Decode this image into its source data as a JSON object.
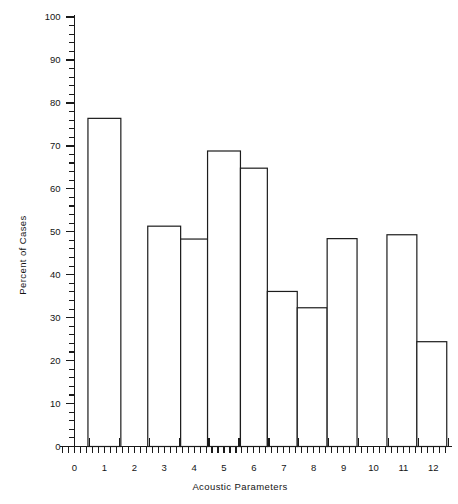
{
  "chart_data": {
    "type": "bar",
    "title": "",
    "subtitle": "",
    "xlabel": "Acoustic Parameters",
    "ylabel": "Percent of Cases",
    "xlim": [
      -0.4,
      12.4
    ],
    "ylim": [
      0,
      100
    ],
    "grid": false,
    "legend": null,
    "x_tick_labels": [
      "0",
      "1",
      "2",
      "3",
      "4",
      "5",
      "6",
      "7",
      "8",
      "9",
      "10",
      "11",
      "12"
    ],
    "x_tick_values": [
      0,
      1,
      2,
      3,
      4,
      5,
      6,
      7,
      8,
      9,
      10,
      11,
      12
    ],
    "x_minor_tick_step": 0.2,
    "y_tick_labels": [
      "0",
      "10",
      "20",
      "30",
      "40",
      "50",
      "60",
      "70",
      "80",
      "90",
      "100"
    ],
    "y_tick_values": [
      0,
      10,
      20,
      30,
      40,
      50,
      60,
      70,
      80,
      90,
      100
    ],
    "y_minor_tick_step": 2,
    "bar_style": "outline-unfilled",
    "bar_fill_color": "#ffffff",
    "bar_edge_color": "#1c1c1c",
    "axis_color": "#1a1a1a",
    "categories": [
      1,
      3,
      4,
      5,
      6,
      7,
      8,
      9,
      11,
      12
    ],
    "values": [
      76.4,
      51.3,
      48.3,
      68.8,
      64.8,
      36.1,
      32.3,
      48.4,
      49.3,
      24.4
    ],
    "bars": [
      {
        "center": 1,
        "left": 0.45,
        "right": 1.55,
        "value": 76.4
      },
      {
        "center": 3,
        "left": 2.45,
        "right": 3.55,
        "value": 51.3
      },
      {
        "center": 4,
        "left": 3.55,
        "right": 4.45,
        "value": 48.3
      },
      {
        "center": 5,
        "left": 4.45,
        "right": 5.55,
        "value": 68.8
      },
      {
        "center": 6,
        "left": 5.55,
        "right": 6.45,
        "value": 64.8
      },
      {
        "center": 7,
        "left": 6.45,
        "right": 7.45,
        "value": 36.1
      },
      {
        "center": 8,
        "left": 7.45,
        "right": 8.45,
        "value": 32.3
      },
      {
        "center": 9,
        "left": 8.45,
        "right": 9.45,
        "value": 48.4
      },
      {
        "center": 11,
        "left": 10.45,
        "right": 11.45,
        "value": 49.3
      },
      {
        "center": 12,
        "left": 11.45,
        "right": 12.45,
        "value": 24.4
      }
    ],
    "missing_categories": [
      0,
      2,
      10
    ]
  },
  "axes": {
    "y_axis_title": "Percent of Cases",
    "x_axis_title": "Acoustic Parameters"
  }
}
